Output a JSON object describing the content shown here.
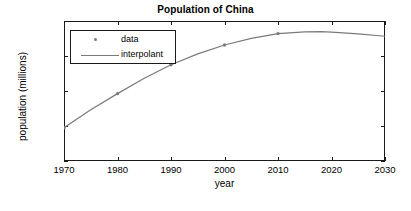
{
  "chart_data": {
    "type": "line",
    "title": "Population of China",
    "xlabel": "year",
    "ylabel": "population (millions)",
    "xlim": [
      1970,
      2030
    ],
    "ylim": [
      600,
      1400
    ],
    "xticks": [
      1970,
      1980,
      1990,
      2000,
      2010,
      2020,
      2030
    ],
    "xticklabels": [
      "1970",
      "1980",
      "1990",
      "2000",
      "2010",
      "2020",
      "2030"
    ],
    "yticks": [
      600,
      800,
      1000,
      1200,
      1400
    ],
    "yticklabels": [
      "600",
      "800",
      "1000",
      "1200",
      "1400"
    ],
    "grid": false,
    "legend_position": "upper left",
    "series": [
      {
        "name": "data",
        "style": "markers",
        "marker": "dot",
        "color": "#7a7a7a",
        "x": [
          1970,
          1980,
          1990,
          2000,
          2010
        ],
        "values": [
          790,
          985,
          1150,
          1263,
          1328
        ]
      },
      {
        "name": "interpolant",
        "style": "line",
        "color": "#7a7a7a",
        "x": [
          1970,
          1975,
          1980,
          1985,
          1990,
          1995,
          2000,
          2005,
          2010,
          2015,
          2018,
          2020,
          2025,
          2030
        ],
        "values": [
          790,
          893,
          985,
          1073,
          1150,
          1212,
          1263,
          1301,
          1328,
          1338,
          1339,
          1337,
          1327,
          1313
        ]
      }
    ]
  },
  "legend": {
    "entries": [
      {
        "label": "data",
        "marker": "dot-marker"
      },
      {
        "label": "interpolant",
        "marker": "line-sample"
      }
    ]
  }
}
